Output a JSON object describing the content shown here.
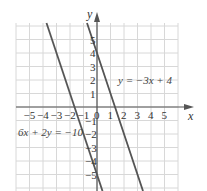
{
  "chart_data": {
    "type": "line",
    "title": "",
    "xlabel": "x",
    "ylabel": "y",
    "xlim": [
      -6,
      6
    ],
    "ylim": [
      -6,
      6
    ],
    "grid": true,
    "x_ticks": [
      "-5",
      "-4",
      "-3",
      "-2",
      "-1",
      "0",
      "1",
      "2",
      "3",
      "4",
      "5"
    ],
    "y_ticks": [
      "5",
      "4",
      "3",
      "2",
      "1",
      "-1",
      "-2",
      "-3",
      "-4",
      "-5"
    ],
    "series": [
      {
        "name": "y = -3x + 4",
        "label": "y = −3x + 4",
        "slope": -3,
        "intercept": 4,
        "x": [
          0.67,
          1.33,
          2,
          3.33
        ],
        "y": [
          2,
          0,
          -2,
          -6
        ]
      },
      {
        "name": "6x + 2y = -10",
        "label": "6x + 2y = −10",
        "slope": -3,
        "intercept": -5,
        "x": [
          -3.67,
          -1.67,
          0,
          0.33
        ],
        "y": [
          6,
          0,
          -5,
          -6
        ]
      }
    ],
    "colors": {
      "line": "#555555",
      "grid": "#d8d8d8",
      "axis": "#555555"
    }
  }
}
